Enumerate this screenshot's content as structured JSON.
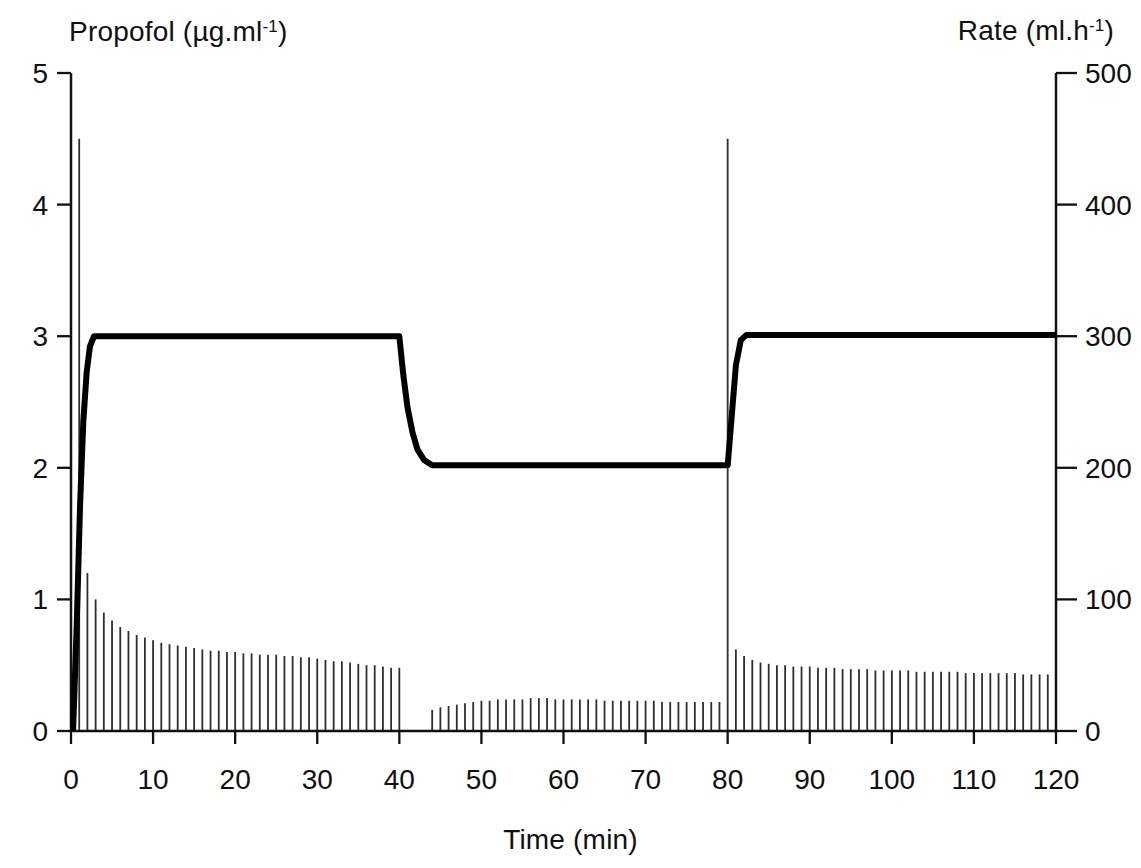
{
  "figure": {
    "background": "#ffffff",
    "ink_color": "#101010",
    "bar_color": "#2e2e2e",
    "curve_color": "#000000"
  },
  "chart_data": {
    "type": "line+impulse",
    "title": "",
    "x_axis": {
      "label": "Time (min)",
      "min": 0,
      "max": 120,
      "ticks": [
        0,
        10,
        20,
        30,
        40,
        50,
        60,
        70,
        80,
        90,
        100,
        110,
        120
      ]
    },
    "y_left_axis": {
      "label_prefix": "Propofol (µg.ml",
      "label_sup": "-1",
      "label_suffix": ")",
      "min": 0,
      "max": 5,
      "ticks": [
        0,
        1,
        2,
        3,
        4,
        5
      ]
    },
    "y_right_axis": {
      "label_prefix": "Rate (ml.h",
      "label_sup": "-1",
      "label_suffix": ")",
      "min": 0,
      "max": 500,
      "ticks": [
        0,
        100,
        200,
        300,
        400,
        500
      ]
    },
    "series": [
      {
        "name": "propofol-concentration",
        "type": "line",
        "axis": "left",
        "points": [
          [
            0.25,
            0
          ],
          [
            0.7,
            0.8
          ],
          [
            1.1,
            1.7
          ],
          [
            1.5,
            2.35
          ],
          [
            1.9,
            2.72
          ],
          [
            2.3,
            2.92
          ],
          [
            2.8,
            3.0
          ],
          [
            40,
            3.0
          ],
          [
            40.5,
            2.7
          ],
          [
            41,
            2.46
          ],
          [
            41.6,
            2.27
          ],
          [
            42.2,
            2.14
          ],
          [
            43,
            2.06
          ],
          [
            44,
            2.02
          ],
          [
            80,
            2.02
          ],
          [
            80.5,
            2.4
          ],
          [
            81,
            2.78
          ],
          [
            81.6,
            2.97
          ],
          [
            82.3,
            3.01
          ],
          [
            120,
            3.01
          ]
        ]
      },
      {
        "name": "infusion-rate",
        "type": "impulse",
        "axis": "right",
        "points": [
          [
            1,
            450
          ],
          [
            2,
            120
          ],
          [
            3,
            100
          ],
          [
            4,
            90
          ],
          [
            5,
            84
          ],
          [
            6,
            79
          ],
          [
            7,
            76
          ],
          [
            8,
            73
          ],
          [
            9,
            71
          ],
          [
            10,
            69
          ],
          [
            11,
            67
          ],
          [
            12,
            66
          ],
          [
            13,
            65
          ],
          [
            14,
            64
          ],
          [
            15,
            63
          ],
          [
            16,
            62
          ],
          [
            17,
            61
          ],
          [
            18,
            61
          ],
          [
            19,
            60
          ],
          [
            20,
            60
          ],
          [
            21,
            59
          ],
          [
            22,
            59
          ],
          [
            23,
            58
          ],
          [
            24,
            58
          ],
          [
            25,
            58
          ],
          [
            26,
            57
          ],
          [
            27,
            57
          ],
          [
            28,
            56
          ],
          [
            29,
            56
          ],
          [
            30,
            55
          ],
          [
            31,
            54
          ],
          [
            32,
            53
          ],
          [
            33,
            53
          ],
          [
            34,
            52
          ],
          [
            35,
            51
          ],
          [
            36,
            50
          ],
          [
            37,
            50
          ],
          [
            38,
            49
          ],
          [
            39,
            48
          ],
          [
            40,
            48
          ],
          [
            41,
            0
          ],
          [
            42,
            0
          ],
          [
            43,
            0
          ],
          [
            44,
            16
          ],
          [
            45,
            18
          ],
          [
            46,
            19
          ],
          [
            47,
            20
          ],
          [
            48,
            21
          ],
          [
            49,
            22
          ],
          [
            50,
            23
          ],
          [
            51,
            23
          ],
          [
            52,
            24
          ],
          [
            53,
            24
          ],
          [
            54,
            24
          ],
          [
            55,
            24
          ],
          [
            56,
            25
          ],
          [
            57,
            25
          ],
          [
            58,
            25
          ],
          [
            59,
            24
          ],
          [
            60,
            24
          ],
          [
            61,
            24
          ],
          [
            62,
            24
          ],
          [
            63,
            24
          ],
          [
            64,
            24
          ],
          [
            65,
            23
          ],
          [
            66,
            23
          ],
          [
            67,
            23
          ],
          [
            68,
            23
          ],
          [
            69,
            23
          ],
          [
            70,
            23
          ],
          [
            71,
            23
          ],
          [
            72,
            22
          ],
          [
            73,
            22
          ],
          [
            74,
            22
          ],
          [
            75,
            22
          ],
          [
            76,
            22
          ],
          [
            77,
            22
          ],
          [
            78,
            22
          ],
          [
            79,
            22
          ],
          [
            80,
            450
          ],
          [
            81,
            62
          ],
          [
            82,
            57
          ],
          [
            83,
            54
          ],
          [
            84,
            52
          ],
          [
            85,
            51
          ],
          [
            86,
            50
          ],
          [
            87,
            50
          ],
          [
            88,
            49
          ],
          [
            89,
            49
          ],
          [
            90,
            49
          ],
          [
            91,
            48
          ],
          [
            92,
            48
          ],
          [
            93,
            48
          ],
          [
            94,
            47
          ],
          [
            95,
            47
          ],
          [
            96,
            47
          ],
          [
            97,
            47
          ],
          [
            98,
            46
          ],
          [
            99,
            46
          ],
          [
            100,
            46
          ],
          [
            101,
            46
          ],
          [
            102,
            46
          ],
          [
            103,
            45
          ],
          [
            104,
            45
          ],
          [
            105,
            45
          ],
          [
            106,
            45
          ],
          [
            107,
            45
          ],
          [
            108,
            45
          ],
          [
            109,
            44
          ],
          [
            110,
            44
          ],
          [
            111,
            44
          ],
          [
            112,
            44
          ],
          [
            113,
            44
          ],
          [
            114,
            44
          ],
          [
            115,
            44
          ],
          [
            116,
            43
          ],
          [
            117,
            43
          ],
          [
            118,
            43
          ],
          [
            119,
            43
          ],
          [
            120,
            43
          ]
        ]
      }
    ],
    "layout_hints": {
      "grid": "off",
      "legend": "none",
      "frame": "left-right-bottom axes, ticks outward"
    }
  }
}
